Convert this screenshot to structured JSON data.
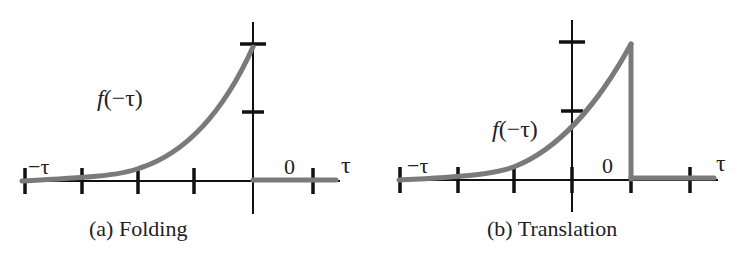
{
  "figure": {
    "panels": [
      {
        "id": "a",
        "caption": "(a) Folding",
        "function_label": "f(−τ)",
        "function_label_italic": "f",
        "function_label_rest": "(−τ)",
        "left_label": "−τ",
        "zero_label": "0",
        "axis_label": "τ"
      },
      {
        "id": "b",
        "caption": "(b) Translation",
        "function_label": "f(−τ)",
        "function_label_italic": "f",
        "function_label_rest": "(−τ)",
        "left_label": "−τ",
        "zero_label": "0",
        "axis_label": "τ"
      }
    ],
    "colors": {
      "curve": "#7a7a7a",
      "axis": "#111111",
      "text": "#222222"
    }
  }
}
